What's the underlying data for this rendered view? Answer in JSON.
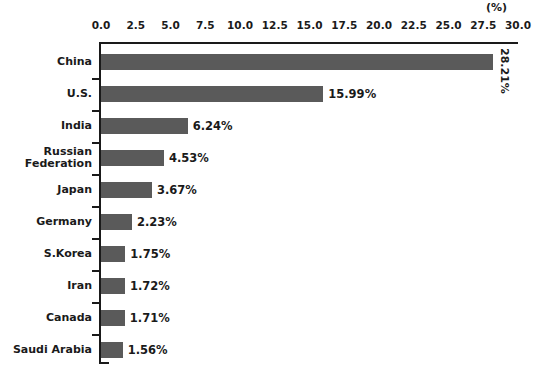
{
  "chart_data": {
    "type": "bar",
    "orientation": "horizontal",
    "title": "",
    "xlabel": "",
    "ylabel": "",
    "unit_label": "(%)",
    "xlim": [
      0.0,
      30.0
    ],
    "xticks": [
      "0.0",
      "2.5",
      "5.0",
      "7.5",
      "10.0",
      "12.5",
      "15.0",
      "17.5",
      "20.0",
      "22.5",
      "25.0",
      "27.5",
      "30.0"
    ],
    "xtick_values": [
      0.0,
      2.5,
      5.0,
      7.5,
      10.0,
      12.5,
      15.0,
      17.5,
      20.0,
      22.5,
      25.0,
      27.5,
      30.0
    ],
    "grid": false,
    "legend": false,
    "bar_color": "#5a5a5a",
    "axis_color": "#1a1a1a",
    "background": "#ffffff",
    "categories": [
      "China",
      "U.S.",
      "India",
      "Russian\nFederation",
      "Japan",
      "Germany",
      "S.Korea",
      "Iran",
      "Canada",
      "Saudi Arabia"
    ],
    "values": [
      28.21,
      15.99,
      6.24,
      4.53,
      3.67,
      2.23,
      1.75,
      1.72,
      1.71,
      1.56
    ],
    "data_labels": [
      "28.21%",
      "15.99%",
      "6.24%",
      "4.53%",
      "3.67%",
      "2.23%",
      "1.75%",
      "1.72%",
      "1.71%",
      "1.56%"
    ],
    "bars": [
      {
        "label": "China",
        "label_line1": "China",
        "label_line2": "",
        "value": 28.21,
        "text": "28.21%",
        "rotated": true
      },
      {
        "label": "U.S.",
        "label_line1": "U.S.",
        "label_line2": "",
        "value": 15.99,
        "text": "15.99%",
        "rotated": false
      },
      {
        "label": "India",
        "label_line1": "India",
        "label_line2": "",
        "value": 6.24,
        "text": "6.24%",
        "rotated": false
      },
      {
        "label": "Russian Federation",
        "label_line1": "Russian",
        "label_line2": "Federation",
        "value": 4.53,
        "text": "4.53%",
        "rotated": false
      },
      {
        "label": "Japan",
        "label_line1": "Japan",
        "label_line2": "",
        "value": 3.67,
        "text": "3.67%",
        "rotated": false
      },
      {
        "label": "Germany",
        "label_line1": "Germany",
        "label_line2": "",
        "value": 2.23,
        "text": "2.23%",
        "rotated": false
      },
      {
        "label": "S.Korea",
        "label_line1": "S.Korea",
        "label_line2": "",
        "value": 1.75,
        "text": "1.75%",
        "rotated": false
      },
      {
        "label": "Iran",
        "label_line1": "Iran",
        "label_line2": "",
        "value": 1.72,
        "text": "1.72%",
        "rotated": false
      },
      {
        "label": "Canada",
        "label_line1": "Canada",
        "label_line2": "",
        "value": 1.71,
        "text": "1.71%",
        "rotated": false
      },
      {
        "label": "Saudi Arabia",
        "label_line1": "Saudi Arabia",
        "label_line2": "",
        "value": 1.56,
        "text": "1.56%",
        "rotated": false
      }
    ]
  }
}
